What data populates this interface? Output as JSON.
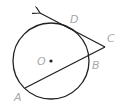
{
  "diagram": {
    "type": "circle-tangent-secant",
    "colors": {
      "stroke": "#222222",
      "label": "#a8a8a8",
      "background": "#ffffff"
    },
    "circle": {
      "center_label": "O",
      "cx": 51,
      "cy": 61,
      "r": 38
    },
    "points": {
      "A": {
        "label": "A",
        "x": 25,
        "y": 88,
        "lx": 14,
        "ly": 101
      },
      "B": {
        "label": "B",
        "x": 88,
        "y": 55,
        "lx": 92,
        "ly": 68
      },
      "C": {
        "label": "C",
        "x": 105,
        "y": 47,
        "lx": 107,
        "ly": 42
      },
      "D": {
        "label": "D",
        "x": 72,
        "y": 29,
        "lx": 71,
        "ly": 23
      },
      "O": {
        "label": "O",
        "x": 51,
        "y": 61,
        "lx": 37,
        "ly": 65
      }
    },
    "segments": [
      {
        "name": "secant-CA",
        "from": "C",
        "to": "A"
      },
      {
        "name": "tangent-ray-CD",
        "from": "C",
        "through": "D",
        "arrow_end": {
          "x": 40,
          "y": 13
        }
      }
    ]
  }
}
